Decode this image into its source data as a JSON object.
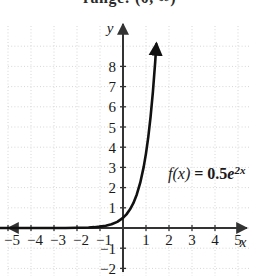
{
  "caption": {
    "text": "range: (0, ∞)"
  },
  "chart_data": {
    "type": "line",
    "title": "",
    "subtitle": "",
    "xlabel": "x",
    "ylabel": "y",
    "xlim": [
      -5.6,
      5.9
    ],
    "ylim": [
      -2.6,
      9.0
    ],
    "grid": true,
    "grid_style": "dotted",
    "legend": "none",
    "annotations": [
      {
        "name": "function-equation",
        "prefix": "f(x)",
        "equals": " = ",
        "coefficient": "0.5",
        "base": "e",
        "exponent": "2x",
        "full_text": "f(x) = 0.5e^(2x)",
        "x": 1.4,
        "y": 2.1
      }
    ],
    "x_ticks": [
      -5,
      -4,
      -3,
      -2,
      -1,
      1,
      2,
      3,
      4,
      5
    ],
    "x_tick_labels": [
      "−5",
      "−4",
      "−3",
      "−2",
      "−1",
      "1",
      "2",
      "3",
      "4",
      "5"
    ],
    "y_ticks": [
      -2,
      -1,
      1,
      2,
      3,
      4,
      5,
      6,
      7,
      8
    ],
    "y_tick_labels": [
      "−2",
      "−1",
      "1",
      "2",
      "3",
      "4",
      "5",
      "6",
      "7",
      "8"
    ],
    "series": [
      {
        "name": "f(x) = 0.5e^(2x)",
        "expression": "0.5*exp(2*x)",
        "color": "#111111",
        "arrow_end": true,
        "x": [
          -5.4,
          -5.0,
          -4.5,
          -4.0,
          -3.5,
          -3.0,
          -2.5,
          -2.0,
          -1.75,
          -1.5,
          -1.25,
          -1.0,
          -0.75,
          -0.5,
          -0.25,
          0.0,
          0.15,
          0.3,
          0.45,
          0.6,
          0.75,
          0.9,
          1.0,
          1.1,
          1.2,
          1.3,
          1.4,
          1.45
        ],
        "y": [
          0.0,
          0.0,
          0.0001,
          0.0002,
          0.0005,
          0.0012,
          0.0034,
          0.0092,
          0.0151,
          0.0249,
          0.041,
          0.0677,
          0.1116,
          0.1839,
          0.3033,
          0.5,
          0.6749,
          0.9111,
          1.2298,
          1.6601,
          2.2408,
          3.0247,
          3.6945,
          4.5126,
          5.5124,
          6.7336,
          8.2248,
          9.0928
        ]
      }
    ]
  },
  "colors": {
    "curve": "#111111",
    "axis": "#333333",
    "grid": "#d8d8d8",
    "text": "#1a1a1a",
    "background": "#ffffff"
  }
}
